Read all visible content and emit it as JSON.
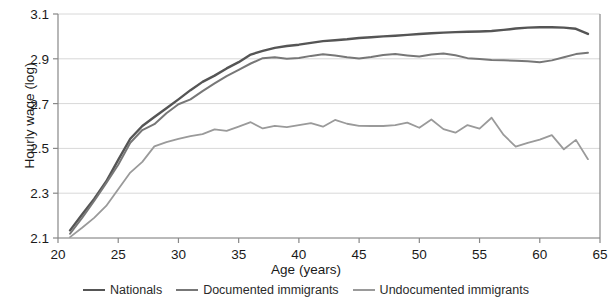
{
  "chart_data": {
    "type": "line",
    "title": "",
    "xlabel": "Age (years)",
    "ylabel": "Hourly wage (log)",
    "xlim": [
      20,
      65
    ],
    "ylim": [
      2.1,
      3.1
    ],
    "xticks": [
      20,
      25,
      30,
      35,
      40,
      45,
      50,
      55,
      60,
      65
    ],
    "yticks": [
      2.1,
      2.3,
      2.5,
      2.7,
      2.9,
      3.1
    ],
    "xtick_labels": [
      "20",
      "25",
      "30",
      "35",
      "40",
      "45",
      "50",
      "55",
      "60",
      "65"
    ],
    "ytick_labels": [
      "2.1",
      "2.3",
      "2.5",
      "2.7",
      "2.9",
      "3.1"
    ],
    "grid": true,
    "grid_axis": "y",
    "legend_position": "bottom",
    "x": [
      21,
      22,
      23,
      24,
      25,
      26,
      27,
      28,
      29,
      30,
      31,
      32,
      33,
      34,
      35,
      36,
      37,
      38,
      39,
      40,
      41,
      42,
      43,
      44,
      45,
      46,
      47,
      48,
      49,
      50,
      51,
      52,
      53,
      54,
      55,
      56,
      57,
      58,
      59,
      60,
      61,
      62,
      63,
      64
    ],
    "series": [
      {
        "name": "Nationals",
        "color": "#555555",
        "values": [
          2.134,
          2.205,
          2.274,
          2.352,
          2.449,
          2.543,
          2.6,
          2.64,
          2.679,
          2.719,
          2.76,
          2.797,
          2.825,
          2.857,
          2.885,
          2.919,
          2.935,
          2.949,
          2.957,
          2.963,
          2.971,
          2.979,
          2.983,
          2.987,
          2.993,
          2.996,
          3.0,
          3.003,
          3.007,
          3.011,
          3.014,
          3.017,
          3.019,
          3.021,
          3.022,
          3.024,
          3.029,
          3.035,
          3.039,
          3.041,
          3.041,
          3.039,
          3.034,
          3.011
        ]
      },
      {
        "name": "Documented immigrants",
        "color": "#777777",
        "values": [
          2.119,
          2.19,
          2.265,
          2.345,
          2.427,
          2.525,
          2.582,
          2.608,
          2.657,
          2.697,
          2.719,
          2.756,
          2.79,
          2.823,
          2.851,
          2.879,
          2.903,
          2.907,
          2.9,
          2.904,
          2.913,
          2.92,
          2.915,
          2.907,
          2.901,
          2.908,
          2.917,
          2.921,
          2.915,
          2.91,
          2.919,
          2.924,
          2.916,
          2.903,
          2.899,
          2.895,
          2.893,
          2.891,
          2.889,
          2.885,
          2.893,
          2.907,
          2.921,
          2.927
        ]
      },
      {
        "name": "Undocumented immigrants",
        "color": "#9a9a9a",
        "values": [
          2.104,
          2.146,
          2.19,
          2.243,
          2.318,
          2.392,
          2.44,
          2.509,
          2.528,
          2.542,
          2.555,
          2.564,
          2.585,
          2.578,
          2.597,
          2.617,
          2.589,
          2.601,
          2.595,
          2.604,
          2.613,
          2.597,
          2.627,
          2.61,
          2.601,
          2.6,
          2.6,
          2.604,
          2.615,
          2.592,
          2.629,
          2.586,
          2.57,
          2.604,
          2.588,
          2.637,
          2.56,
          2.508,
          2.525,
          2.539,
          2.559,
          2.496,
          2.538,
          2.452
        ]
      }
    ]
  },
  "legend": {
    "items": [
      {
        "label": "Nationals",
        "color": "#555555"
      },
      {
        "label": "Documented immigrants",
        "color": "#777777"
      },
      {
        "label": "Undocumented immigrants",
        "color": "#9a9a9a"
      }
    ]
  },
  "axes": {
    "axis_color": "#888888",
    "grid_color": "#d8d8d8"
  }
}
